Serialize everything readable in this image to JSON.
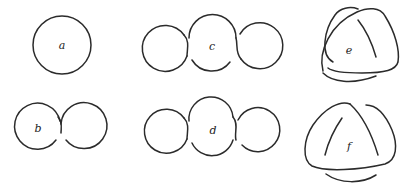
{
  "figure": {
    "stroke_color": "#2b2b2b",
    "background": "#ffffff",
    "panels": [
      {
        "id": "a",
        "label": "a",
        "kind": "unknot circle"
      },
      {
        "id": "b",
        "label": "b",
        "kind": "two-lobe diagram with one crossing"
      },
      {
        "id": "c",
        "label": "c",
        "kind": "three-lobe diagram with two crossings"
      },
      {
        "id": "d",
        "label": "d",
        "kind": "three-lobe diagram with two crossings (alternate)"
      },
      {
        "id": "e",
        "label": "e",
        "kind": "trefoil-like diagram"
      },
      {
        "id": "f",
        "label": "f",
        "kind": "trefoil-like diagram (alternate)"
      }
    ]
  }
}
